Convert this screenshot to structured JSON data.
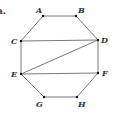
{
  "figure": {
    "part_label": "a.",
    "colors": {
      "line": "#6a6a6a",
      "point": "#111111",
      "text": "#333333"
    },
    "vertices": [
      {
        "name": "A",
        "x": 43,
        "y": 16,
        "lx": 36,
        "ly": 13
      },
      {
        "name": "B",
        "x": 76,
        "y": 16,
        "lx": 78,
        "ly": 13
      },
      {
        "name": "C",
        "x": 21,
        "y": 41,
        "lx": 11,
        "ly": 44
      },
      {
        "name": "D",
        "x": 98,
        "y": 40,
        "lx": 101,
        "ly": 43
      },
      {
        "name": "E",
        "x": 21,
        "y": 74,
        "lx": 11,
        "ly": 77
      },
      {
        "name": "F",
        "x": 98,
        "y": 73,
        "lx": 102,
        "ly": 76
      },
      {
        "name": "G",
        "x": 44,
        "y": 97,
        "lx": 36,
        "ly": 107
      },
      {
        "name": "H",
        "x": 77,
        "y": 97,
        "lx": 78,
        "ly": 107
      }
    ],
    "edges": [
      [
        "A",
        "B"
      ],
      [
        "B",
        "D"
      ],
      [
        "D",
        "F"
      ],
      [
        "F",
        "H"
      ],
      [
        "H",
        "G"
      ],
      [
        "G",
        "E"
      ],
      [
        "E",
        "C"
      ],
      [
        "C",
        "A"
      ],
      [
        "C",
        "D"
      ],
      [
        "E",
        "D"
      ],
      [
        "E",
        "F"
      ]
    ]
  }
}
